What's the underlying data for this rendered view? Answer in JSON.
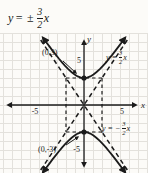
{
  "title": {
    "lhs": "y",
    "eq": "=",
    "pm": "±",
    "num": "3",
    "den": "2",
    "var": "x"
  },
  "graph": {
    "axis_labels": {
      "x": "x",
      "y": "y"
    },
    "tick_labels": {
      "x_neg": "-5",
      "x_pos": "5",
      "y_pos": "5",
      "y_neg": "-5"
    },
    "point_labels": {
      "upper": "(0,3)",
      "lower": "(0,-3)"
    },
    "curve_labels": {
      "upper": {
        "lhs": "y =",
        "num": "3",
        "den": "2",
        "var": "x"
      },
      "lower": {
        "lhs": "y = −",
        "num": "3",
        "den": "2",
        "var": "x"
      }
    }
  },
  "colors": {
    "ink": "#1b1b1b",
    "grid": "#e3e1dc",
    "paper": "#fcfbf8"
  },
  "chart_data": {
    "type": "line",
    "equation": "y²/9 − x²/4 = 1",
    "a": 3,
    "b": 2,
    "vertices": [
      [
        0,
        3
      ],
      [
        0,
        -3
      ]
    ],
    "asymptotes": [
      "y = (3/2)x",
      "y = -(3/2)x"
    ],
    "asymptote_slopes": [
      1.5,
      -1.5
    ],
    "x_ticks": [
      -5,
      5
    ],
    "y_ticks": [
      5,
      -5
    ],
    "xlim": [
      -7.5,
      7
    ],
    "ylim": [
      -7.5,
      7.5
    ],
    "grid": true,
    "x": [
      -4,
      -3,
      -2,
      -1,
      0,
      1,
      2,
      3,
      4
    ],
    "series": [
      {
        "name": "upper branch",
        "equation": "y = 3·sqrt(1 + x²/4)",
        "values": [
          6.71,
          5.41,
          4.24,
          3.35,
          3.0,
          3.35,
          4.24,
          5.41,
          6.71
        ]
      },
      {
        "name": "lower branch",
        "equation": "y = -3·sqrt(1 + x²/4)",
        "values": [
          -6.71,
          -5.41,
          -4.24,
          -3.35,
          -3.0,
          -3.35,
          -4.24,
          -5.41,
          -6.71
        ]
      }
    ]
  }
}
